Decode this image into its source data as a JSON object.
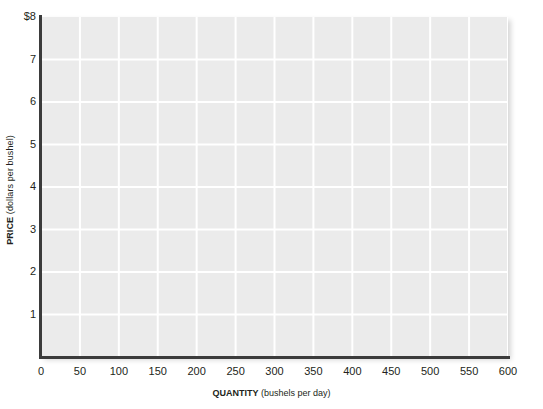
{
  "chart_data": {
    "type": "line",
    "title": "",
    "subtitle": "",
    "xlabel_name": "QUANTITY",
    "xlabel_units": "(bushels per day)",
    "ylabel_name": "PRICE",
    "ylabel_units": "(dollars per bushel)",
    "xlim": [
      0,
      600
    ],
    "ylim": [
      0,
      8
    ],
    "x_ticks": [
      0,
      50,
      100,
      150,
      200,
      250,
      300,
      350,
      400,
      450,
      500,
      550,
      600
    ],
    "x_tick_labels": [
      "0",
      "50",
      "100",
      "150",
      "200",
      "250",
      "300",
      "350",
      "400",
      "450",
      "500",
      "550",
      "600"
    ],
    "y_ticks": [
      1,
      2,
      3,
      4,
      5,
      6,
      7,
      8
    ],
    "y_tick_labels": [
      "1",
      "2",
      "3",
      "4",
      "5",
      "6",
      "7",
      "$8"
    ],
    "grid": true,
    "grid_color": "#ffffff",
    "plot_background": "#ebebeb",
    "axis_color": "#3b3b3b",
    "legend": null,
    "legend_position": "none",
    "series": [],
    "annotations": [],
    "note": "Blank grid; no data series are plotted in the figure."
  },
  "colors": {
    "page_background": "#ffffff",
    "plot_background": "#ebebeb",
    "gridline": "#ffffff",
    "axis": "#3b3b3b",
    "text": "#231f20"
  }
}
